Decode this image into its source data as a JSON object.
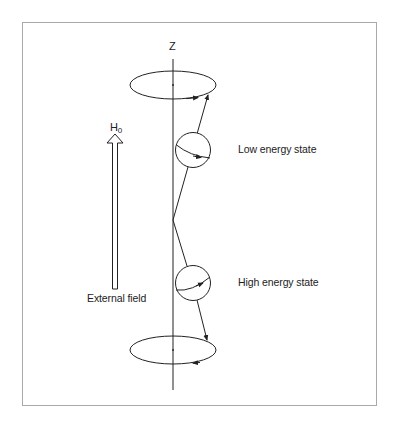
{
  "diagram": {
    "type": "nuclear spin precession in external magnetic field",
    "axis_label": "Z",
    "field_label": "H",
    "field_label_subscript": "0",
    "field_caption": "External field",
    "states": [
      {
        "label": "Low energy state",
        "orientation": "aligned with field (spin up)"
      },
      {
        "label": "High energy state",
        "orientation": "opposed to field (spin down)"
      }
    ],
    "colors": {
      "line": "#222222",
      "frame": "#a9a9a9",
      "background": "#ffffff"
    }
  }
}
